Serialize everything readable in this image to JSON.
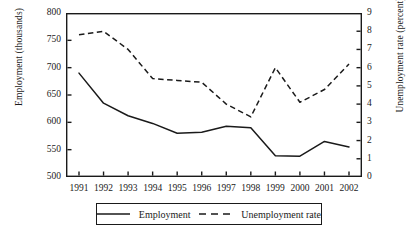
{
  "axes": {
    "left_title": "Employment (thousands)",
    "right_title": "Unemployment rate (percent)",
    "left_ticks": [
      "800",
      "750",
      "700",
      "650",
      "600",
      "550",
      "500"
    ],
    "right_ticks": [
      "9",
      "8",
      "7",
      "6",
      "5",
      "4",
      "3",
      "2",
      "1",
      "0"
    ],
    "x_ticks": [
      "1991",
      "1992",
      "1993",
      "1994",
      "1995",
      "1996",
      "1997",
      "1998",
      "1999",
      "2000",
      "2001",
      "2002"
    ]
  },
  "legend": {
    "employment_label": "Employment",
    "unemployment_label": "Unemployment rate"
  },
  "colors": {
    "line": "#1a1a1a",
    "frame": "#1a1a1a",
    "background": "#ffffff"
  },
  "chart_data": {
    "type": "line",
    "title": "",
    "xlabel": "",
    "grid": false,
    "legend_position": "bottom",
    "x": [
      1991,
      1992,
      1993,
      1994,
      1995,
      1996,
      1997,
      1998,
      1999,
      2000,
      2001,
      2002
    ],
    "categories": [
      "1991",
      "1992",
      "1993",
      "1994",
      "1995",
      "1996",
      "1997",
      "1998",
      "1999",
      "2000",
      "2001",
      "2002"
    ],
    "series": [
      {
        "name": "Employment",
        "axis": "left",
        "style": "solid",
        "ylabel": "Employment (thousands)",
        "ylim": [
          500,
          800
        ],
        "ytick_step": 50,
        "values": [
          690,
          635,
          612,
          598,
          580,
          582,
          593,
          590,
          539,
          538,
          565,
          555
        ]
      },
      {
        "name": "Unemployment rate",
        "axis": "right",
        "style": "dashed",
        "ylabel": "Unemployment rate (percent)",
        "ylim": [
          0,
          9
        ],
        "ytick_step": 1,
        "values": [
          7.8,
          8.0,
          7.0,
          5.4,
          5.3,
          5.2,
          4.0,
          3.3,
          6.0,
          4.1,
          4.8,
          6.2
        ]
      }
    ]
  }
}
